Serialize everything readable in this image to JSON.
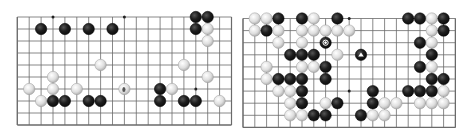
{
  "boards": [
    {
      "id": "left",
      "origin": [
        17.3,
        17
      ],
      "spacing": [
        11.9,
        12.0
      ],
      "cols": 19,
      "rows": 10,
      "star_points": [
        [
          3,
          0
        ],
        [
          9,
          0
        ],
        [
          15,
          6
        ]
      ],
      "stones": [
        {
          "c": 15,
          "r": 0,
          "color": "black"
        },
        {
          "c": 16,
          "r": 0,
          "color": "black"
        },
        {
          "c": 2,
          "r": 1,
          "color": "black"
        },
        {
          "c": 4,
          "r": 1,
          "color": "black"
        },
        {
          "c": 6,
          "r": 1,
          "color": "black"
        },
        {
          "c": 8,
          "r": 1,
          "color": "black"
        },
        {
          "c": 15,
          "r": 1,
          "color": "black"
        },
        {
          "c": 16,
          "r": 1,
          "color": "white"
        },
        {
          "c": 16,
          "r": 2,
          "color": "white"
        },
        {
          "c": 7,
          "r": 4,
          "color": "white"
        },
        {
          "c": 14,
          "r": 4,
          "color": "white"
        },
        {
          "c": 3,
          "r": 5,
          "color": "white"
        },
        {
          "c": 16,
          "r": 5,
          "color": "white"
        },
        {
          "c": 1,
          "r": 6,
          "color": "white"
        },
        {
          "c": 3,
          "r": 6,
          "color": "white"
        },
        {
          "c": 5,
          "r": 6,
          "color": "white"
        },
        {
          "c": 9,
          "r": 6,
          "color": "white",
          "mark": "dot"
        },
        {
          "c": 12,
          "r": 6,
          "color": "black"
        },
        {
          "c": 13,
          "r": 6,
          "color": "white"
        },
        {
          "c": 2,
          "r": 7,
          "color": "white"
        },
        {
          "c": 3,
          "r": 7,
          "color": "black"
        },
        {
          "c": 4,
          "r": 7,
          "color": "black"
        },
        {
          "c": 6,
          "r": 7,
          "color": "black"
        },
        {
          "c": 7,
          "r": 7,
          "color": "black"
        },
        {
          "c": 12,
          "r": 7,
          "color": "black"
        },
        {
          "c": 14,
          "r": 7,
          "color": "black"
        },
        {
          "c": 15,
          "r": 7,
          "color": "black"
        },
        {
          "c": 17,
          "r": 7,
          "color": "white"
        }
      ]
    },
    {
      "id": "right",
      "origin": [
        243,
        18.5
      ],
      "spacing": [
        11.8,
        12.1
      ],
      "cols": 19,
      "rows": 10,
      "star_points": [
        [
          3,
          0
        ],
        [
          9,
          0
        ],
        [
          9,
          6
        ],
        [
          15,
          6
        ]
      ],
      "stones": [
        {
          "c": 1,
          "r": 0,
          "color": "white"
        },
        {
          "c": 2,
          "r": 0,
          "color": "white"
        },
        {
          "c": 3,
          "r": 0,
          "color": "black"
        },
        {
          "c": 5,
          "r": 0,
          "color": "black"
        },
        {
          "c": 6,
          "r": 0,
          "color": "white"
        },
        {
          "c": 8,
          "r": 0,
          "color": "black"
        },
        {
          "c": 14,
          "r": 0,
          "color": "black"
        },
        {
          "c": 15,
          "r": 0,
          "color": "black"
        },
        {
          "c": 16,
          "r": 0,
          "color": "white"
        },
        {
          "c": 17,
          "r": 0,
          "color": "black"
        },
        {
          "c": 1,
          "r": 1,
          "color": "white"
        },
        {
          "c": 2,
          "r": 1,
          "color": "black"
        },
        {
          "c": 3,
          "r": 1,
          "color": "white"
        },
        {
          "c": 5,
          "r": 1,
          "color": "white"
        },
        {
          "c": 6,
          "r": 1,
          "color": "white"
        },
        {
          "c": 7,
          "r": 1,
          "color": "white"
        },
        {
          "c": 8,
          "r": 1,
          "color": "white"
        },
        {
          "c": 9,
          "r": 1,
          "color": "white"
        },
        {
          "c": 16,
          "r": 1,
          "color": "white"
        },
        {
          "c": 17,
          "r": 1,
          "color": "black"
        },
        {
          "c": 3,
          "r": 2,
          "color": "white"
        },
        {
          "c": 5,
          "r": 2,
          "color": "white"
        },
        {
          "c": 7,
          "r": 2,
          "color": "black",
          "mark": "diamond"
        },
        {
          "c": 15,
          "r": 2,
          "color": "black"
        },
        {
          "c": 16,
          "r": 2,
          "color": "white"
        },
        {
          "c": 4,
          "r": 3,
          "color": "black"
        },
        {
          "c": 5,
          "r": 3,
          "color": "black"
        },
        {
          "c": 6,
          "r": 3,
          "color": "black"
        },
        {
          "c": 8,
          "r": 3,
          "color": "white"
        },
        {
          "c": 10,
          "r": 3,
          "color": "black",
          "mark": "triangle"
        },
        {
          "c": 16,
          "r": 3,
          "color": "black"
        },
        {
          "c": 2,
          "r": 4,
          "color": "white"
        },
        {
          "c": 5,
          "r": 4,
          "color": "white"
        },
        {
          "c": 6,
          "r": 4,
          "color": "white"
        },
        {
          "c": 7,
          "r": 4,
          "color": "black"
        },
        {
          "c": 15,
          "r": 4,
          "color": "black"
        },
        {
          "c": 16,
          "r": 4,
          "color": "white"
        },
        {
          "c": 2,
          "r": 5,
          "color": "white"
        },
        {
          "c": 3,
          "r": 5,
          "color": "black"
        },
        {
          "c": 4,
          "r": 5,
          "color": "black"
        },
        {
          "c": 5,
          "r": 5,
          "color": "black"
        },
        {
          "c": 7,
          "r": 5,
          "color": "black"
        },
        {
          "c": 16,
          "r": 5,
          "color": "black"
        },
        {
          "c": 17,
          "r": 5,
          "color": "black"
        },
        {
          "c": 3,
          "r": 6,
          "color": "white"
        },
        {
          "c": 4,
          "r": 6,
          "color": "white"
        },
        {
          "c": 5,
          "r": 6,
          "color": "black"
        },
        {
          "c": 11,
          "r": 6,
          "color": "black"
        },
        {
          "c": 14,
          "r": 6,
          "color": "black"
        },
        {
          "c": 15,
          "r": 6,
          "color": "black"
        },
        {
          "c": 16,
          "r": 6,
          "color": "black"
        },
        {
          "c": 17,
          "r": 6,
          "color": "white"
        },
        {
          "c": 4,
          "r": 7,
          "color": "white"
        },
        {
          "c": 5,
          "r": 7,
          "color": "black"
        },
        {
          "c": 7,
          "r": 7,
          "color": "white"
        },
        {
          "c": 8,
          "r": 7,
          "color": "black"
        },
        {
          "c": 11,
          "r": 7,
          "color": "black"
        },
        {
          "c": 12,
          "r": 7,
          "color": "white"
        },
        {
          "c": 13,
          "r": 7,
          "color": "white"
        },
        {
          "c": 15,
          "r": 7,
          "color": "white"
        },
        {
          "c": 16,
          "r": 7,
          "color": "white"
        },
        {
          "c": 17,
          "r": 7,
          "color": "white"
        },
        {
          "c": 4,
          "r": 8,
          "color": "white"
        },
        {
          "c": 5,
          "r": 8,
          "color": "white"
        },
        {
          "c": 6,
          "r": 8,
          "color": "black"
        },
        {
          "c": 7,
          "r": 8,
          "color": "black"
        },
        {
          "c": 10,
          "r": 8,
          "color": "black"
        },
        {
          "c": 11,
          "r": 8,
          "color": "white"
        },
        {
          "c": 12,
          "r": 8,
          "color": "white"
        }
      ]
    }
  ],
  "colors": {
    "line": "#6a6a6a",
    "black_stone": "#1c1c1c",
    "white_stone": "#e6e6e6",
    "white_stone_edge": "#9a9a9a",
    "background": "#ffffff"
  }
}
